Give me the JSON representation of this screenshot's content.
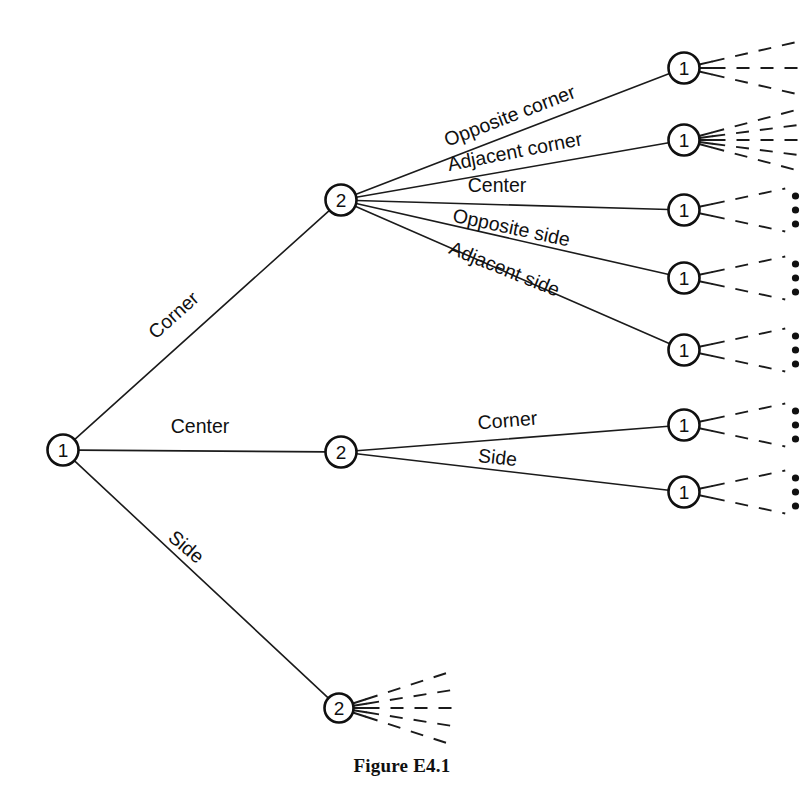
{
  "figure": {
    "caption": "Figure E4.1",
    "caption_x": 402,
    "caption_y": 768,
    "width": 804,
    "height": 809,
    "background": "#ffffff",
    "ink_color": "#101010"
  },
  "nodes": [
    {
      "id": "root",
      "label": "1",
      "x": 63,
      "y": 450,
      "r": 15.5
    },
    {
      "id": "l1-corner",
      "label": "2",
      "x": 341,
      "y": 200,
      "r": 15.5
    },
    {
      "id": "l1-center",
      "label": "2",
      "x": 341,
      "y": 452,
      "r": 15.5
    },
    {
      "id": "l1-side",
      "label": "2",
      "x": 339,
      "y": 708,
      "r": 14.5
    },
    {
      "id": "l2-a",
      "label": "1",
      "x": 684,
      "y": 68,
      "r": 15.5
    },
    {
      "id": "l2-b",
      "label": "1",
      "x": 684,
      "y": 140,
      "r": 15.5
    },
    {
      "id": "l2-c",
      "label": "1",
      "x": 684,
      "y": 210,
      "r": 15.5
    },
    {
      "id": "l2-d",
      "label": "1",
      "x": 684,
      "y": 278,
      "r": 15.5
    },
    {
      "id": "l2-e",
      "label": "1",
      "x": 684,
      "y": 350,
      "r": 15.5
    },
    {
      "id": "l2-f",
      "label": "1",
      "x": 684,
      "y": 425,
      "r": 15.5
    },
    {
      "id": "l2-g",
      "label": "1",
      "x": 684,
      "y": 492,
      "r": 15.5
    }
  ],
  "edges": [
    {
      "id": "e-root-corner",
      "from": "root",
      "to": "l1-corner",
      "label": "Corner",
      "label_x": 178,
      "label_y": 320,
      "label_angle": -42,
      "label_anchor": "middle"
    },
    {
      "id": "e-root-center",
      "from": "root",
      "to": "l1-center",
      "label": "Center",
      "label_x": 200,
      "label_y": 433,
      "label_angle": 0,
      "label_anchor": "middle"
    },
    {
      "id": "e-root-side",
      "from": "root",
      "to": "l1-side",
      "label": "Side",
      "label_x": 182,
      "label_y": 552,
      "label_angle": 40,
      "label_anchor": "middle"
    },
    {
      "id": "e-c-opp-corner",
      "from": "l1-corner",
      "to": "l2-a",
      "label": "Opposite corner",
      "label_x": 512,
      "label_y": 122,
      "label_angle": -21,
      "label_anchor": "middle"
    },
    {
      "id": "e-c-adj-corner",
      "from": "l1-corner",
      "to": "l2-b",
      "label": "Adjacent corner",
      "label_x": 516,
      "label_y": 158,
      "label_angle": -11,
      "label_anchor": "middle"
    },
    {
      "id": "e-c-center",
      "from": "l1-corner",
      "to": "l2-c",
      "label": "Center",
      "label_x": 497,
      "label_y": 192,
      "label_angle": 0,
      "label_anchor": "middle"
    },
    {
      "id": "e-c-opp-side",
      "from": "l1-corner",
      "to": "l2-d",
      "label": "Opposite side",
      "label_x": 510,
      "label_y": 234,
      "label_angle": 12,
      "label_anchor": "middle"
    },
    {
      "id": "e-c-adj-side",
      "from": "l1-corner",
      "to": "l2-e",
      "label": "Adjacent side",
      "label_x": 502,
      "label_y": 275,
      "label_angle": 22,
      "label_anchor": "middle"
    },
    {
      "id": "e-ct-corner",
      "from": "l1-center",
      "to": "l2-f",
      "label": "Corner",
      "label_x": 508,
      "label_y": 427,
      "label_angle": -5,
      "label_anchor": "middle"
    },
    {
      "id": "e-ct-side",
      "from": "l1-center",
      "to": "l2-g",
      "label": "Side",
      "label_x": 497,
      "label_y": 464,
      "label_angle": 6,
      "label_anchor": "middle"
    }
  ],
  "continuations": [
    {
      "id": "cont-l2-a",
      "node": "l2-a",
      "branches": 3,
      "spread": 26,
      "length": 100,
      "dots": 0
    },
    {
      "id": "cont-l2-b",
      "node": "l2-b",
      "branches": 5,
      "spread": 30,
      "length": 100,
      "dots": 0
    },
    {
      "id": "cont-l2-c",
      "node": "l2-c",
      "branches": 2,
      "spread": 24,
      "length": 88,
      "dots": 3
    },
    {
      "id": "cont-l2-d",
      "node": "l2-d",
      "branches": 2,
      "spread": 24,
      "length": 88,
      "dots": 3
    },
    {
      "id": "cont-l2-e",
      "node": "l2-e",
      "branches": 2,
      "spread": 24,
      "length": 88,
      "dots": 3
    },
    {
      "id": "cont-l2-f",
      "node": "l2-f",
      "branches": 2,
      "spread": 24,
      "length": 88,
      "dots": 3
    },
    {
      "id": "cont-l2-g",
      "node": "l2-g",
      "branches": 2,
      "spread": 24,
      "length": 88,
      "dots": 3
    },
    {
      "id": "cont-l1-side",
      "node": "l1-side",
      "branches": 5,
      "spread": 36,
      "length": 108,
      "dots": 0
    }
  ]
}
